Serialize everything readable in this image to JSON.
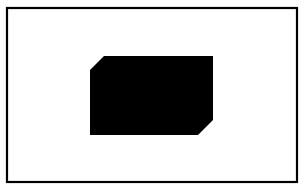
{
  "canvas": {
    "width": 306,
    "height": 188,
    "background": "#ffffff"
  },
  "frame": {
    "x": 7,
    "y": 8,
    "width": 290,
    "height": 174,
    "stroke": "#000000",
    "stroke_width": 2.2,
    "fill": "#ffffff"
  },
  "shape": {
    "kind": "chamfered-rectangle",
    "fill": "#000000",
    "points": "104,56 213,56 213,120 198,135 90,135 90,70"
  }
}
